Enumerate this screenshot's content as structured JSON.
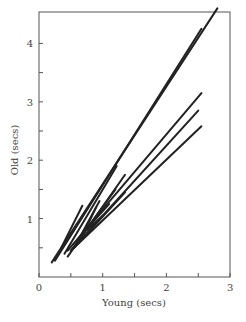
{
  "chart_data": {
    "type": "line",
    "title": "",
    "xlabel": "Young (secs)",
    "ylabel": "Old (secs)",
    "xlim": [
      0,
      3
    ],
    "ylim": [
      0,
      4.6
    ],
    "x_ticks": [
      0,
      0.5,
      1,
      1.5,
      2,
      2.5,
      3
    ],
    "x_tick_labels": [
      "0",
      "",
      "1",
      "",
      "2",
      "",
      "3"
    ],
    "y_ticks": [
      0.5,
      1,
      1.5,
      2,
      2.5,
      3,
      3.5,
      4
    ],
    "y_tick_labels": [
      "",
      "1",
      "",
      "2",
      "",
      "3",
      "",
      "4"
    ],
    "grid": false,
    "legend": "none",
    "line_color": "#222222",
    "series": [
      {
        "name": "line-1",
        "x": [
          0.2,
          2.8
        ],
        "y": [
          0.25,
          4.6
        ]
      },
      {
        "name": "line-2",
        "x": [
          0.25,
          2.55
        ],
        "y": [
          0.28,
          4.25
        ]
      },
      {
        "name": "line-3",
        "x": [
          0.45,
          2.55
        ],
        "y": [
          0.45,
          3.15
        ]
      },
      {
        "name": "line-4",
        "x": [
          0.5,
          2.5
        ],
        "y": [
          0.45,
          2.85
        ]
      },
      {
        "name": "line-5",
        "x": [
          0.55,
          2.55
        ],
        "y": [
          0.5,
          2.58
        ]
      },
      {
        "name": "line-6",
        "x": [
          0.35,
          0.68
        ],
        "y": [
          0.5,
          1.22
        ]
      },
      {
        "name": "line-7",
        "x": [
          0.4,
          1.22
        ],
        "y": [
          0.4,
          1.9
        ]
      },
      {
        "name": "line-8",
        "x": [
          0.45,
          1.35
        ],
        "y": [
          0.35,
          1.75
        ]
      },
      {
        "name": "line-9",
        "x": [
          0.5,
          1.2
        ],
        "y": [
          0.45,
          1.5
        ]
      },
      {
        "name": "line-10",
        "x": [
          0.55,
          1.35
        ],
        "y": [
          0.5,
          1.45
        ]
      },
      {
        "name": "line-11",
        "x": [
          0.6,
          0.95
        ],
        "y": [
          0.6,
          1.3
        ]
      },
      {
        "name": "line-12",
        "x": [
          0.65,
          1.1
        ],
        "y": [
          0.7,
          1.25
        ]
      },
      {
        "name": "line-13",
        "x": [
          0.7,
          0.9
        ],
        "y": [
          0.75,
          1.2
        ]
      },
      {
        "name": "line-14",
        "x": [
          0.75,
          1.0
        ],
        "y": [
          0.8,
          1.05
        ]
      }
    ]
  }
}
